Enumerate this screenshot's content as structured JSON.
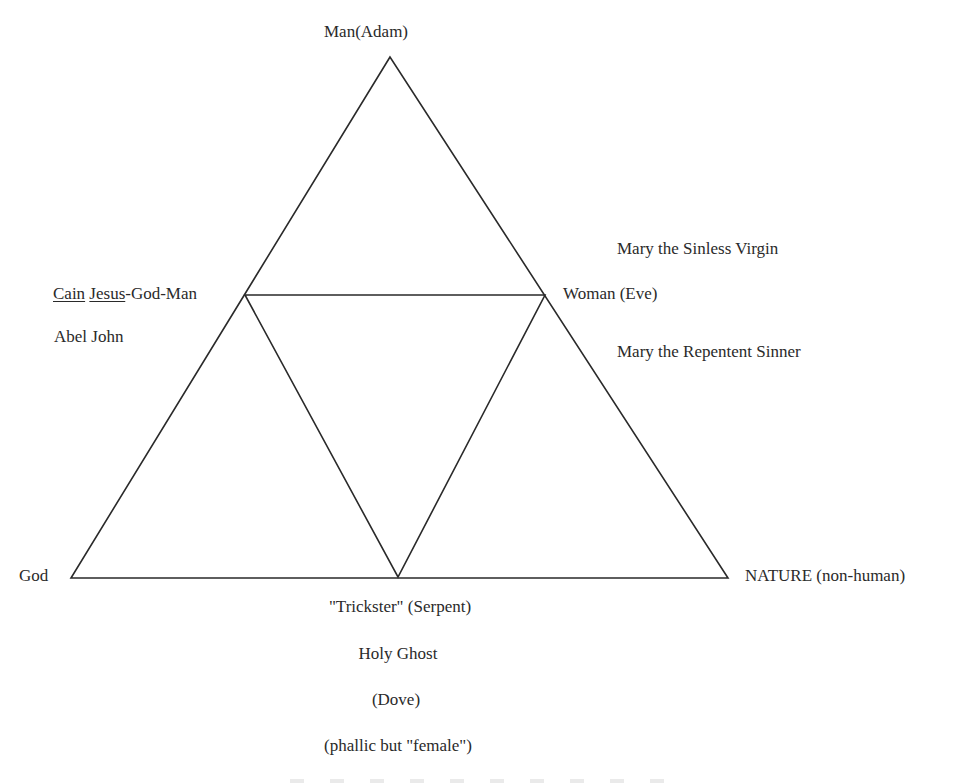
{
  "diagram": {
    "vertices": {
      "top": "Man(Adam)",
      "left_bottom": "God",
      "right_bottom": "NATURE (non-human)"
    },
    "midpoints": {
      "left": {
        "underlined_1": "Cain",
        "underlined_2": "Jesus",
        "rest": "-God-Man",
        "below": "Abel John"
      },
      "right": {
        "label": "Woman (Eve)",
        "above": "Mary the Sinless Virgin",
        "below": "Mary the Repentent Sinner"
      },
      "bottom": {
        "line1": "\"Trickster\" (Serpent)",
        "line2": "Holy  Ghost",
        "line3": "(Dove)",
        "line4": "(phallic but \"female\")"
      }
    },
    "geometry": {
      "outer_triangle": [
        [
          390,
          57
        ],
        [
          71,
          578
        ],
        [
          728,
          578
        ]
      ],
      "inner_triangle": [
        [
          245,
          295
        ],
        [
          545,
          295
        ],
        [
          398,
          577
        ]
      ]
    },
    "line_color": "#2a2a2a"
  }
}
